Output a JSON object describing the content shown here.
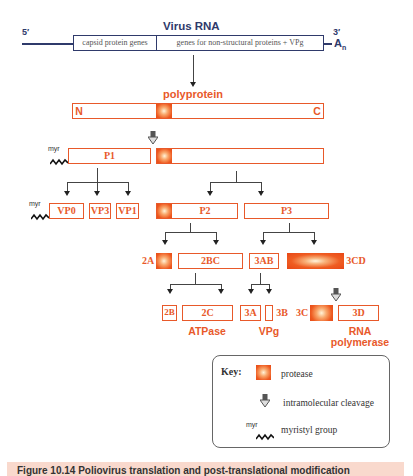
{
  "rna": {
    "title": "Virus RNA",
    "five_prime": "5′",
    "three_prime": "3′",
    "poly_a": "A",
    "poly_a_sub": "n",
    "segment_capsid": "capsid protein genes",
    "segment_nonstructural": "genes for non-structural proteins + VPg"
  },
  "polyprotein": {
    "label": "polyprotein",
    "n_terminus": "N",
    "c_terminus": "C"
  },
  "proteins": {
    "p1": "P1",
    "p2": "P2",
    "p3": "P3",
    "vp0": "VP0",
    "vp3": "VP3",
    "vp1": "VP1",
    "a2": "2A",
    "bc2": "2BC",
    "ab3": "3AB",
    "cd3": "3CD",
    "b2": "2B",
    "c2": "2C",
    "a3": "3A",
    "b3": "3B",
    "c3": "3C",
    "d3": "3D"
  },
  "functions": {
    "atpase": "ATPase",
    "vpg": "VPg",
    "rna_polymerase_1": "RNA",
    "rna_polymerase_2": "polymerase"
  },
  "myr_label": "myr",
  "key": {
    "title": "Key:",
    "protease": "protease",
    "cleavage": "intramolecular cleavage",
    "myr_prefix": "myr",
    "myristyl": "myristyl group"
  },
  "caption": {
    "text": "Figure 10.14  Poliovirus translation and post-translational modification"
  },
  "colors": {
    "orange": "#e8592a",
    "navy": "#2f3a6b",
    "caption_bg": "#f9d9cd"
  }
}
